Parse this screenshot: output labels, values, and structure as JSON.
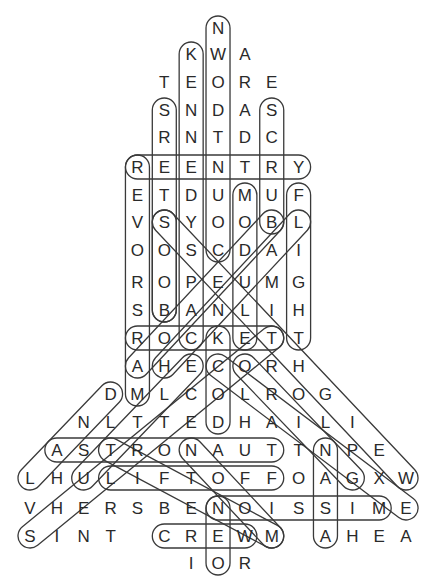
{
  "puzzle": {
    "type": "word-search",
    "grid_origin": {
      "x": 30,
      "y_rows": [
        28,
        54,
        82,
        110,
        137,
        167,
        195,
        222,
        250,
        282,
        310,
        338,
        366,
        394,
        422,
        450,
        478,
        508,
        536,
        563
      ]
    },
    "col_step": 26.86,
    "rows": [
      {
        "r": 0,
        "start": 7,
        "letters": "N"
      },
      {
        "r": 1,
        "start": 6,
        "letters": "KWA"
      },
      {
        "r": 2,
        "start": 5,
        "letters": "TEORE"
      },
      {
        "r": 3,
        "start": 5,
        "letters": "SNDAS"
      },
      {
        "r": 4,
        "start": 5,
        "letters": "RNTDC"
      },
      {
        "r": 5,
        "start": 4,
        "letters": "REENTRY"
      },
      {
        "r": 6,
        "start": 4,
        "letters": "ETDUMUF"
      },
      {
        "r": 7,
        "start": 4,
        "letters": "VSYOOBL"
      },
      {
        "r": 8,
        "start": 4,
        "letters": "OOSCDAI"
      },
      {
        "r": 9,
        "start": 4,
        "letters": "ROPEUMG"
      },
      {
        "r": 10,
        "start": 4,
        "letters": "SBANLIH"
      },
      {
        "r": 11,
        "start": 4,
        "letters": "ROCKETT"
      },
      {
        "r": 12,
        "start": 4,
        "letters": "AHECORH"
      },
      {
        "r": 13,
        "start": 3,
        "letters": "DMLCOLROG"
      },
      {
        "r": 14,
        "start": 2,
        "letters": "NLTTEDHAILI"
      },
      {
        "r": 15,
        "start": 1,
        "letters": "ASTRONAUTTNPE"
      },
      {
        "r": 16,
        "start": 0,
        "letters": "LHULIFTOFFOAGXW"
      },
      {
        "r": 17,
        "start": 0,
        "letters": "VHERSBENOISSIME"
      },
      {
        "r": 18,
        "start": 0,
        "letters": "SINT CREWM AHEA"
      },
      {
        "r": 19,
        "start": 6,
        "letters": "IOR"
      }
    ],
    "capsules": [
      {
        "word": "COUNTDOWN",
        "from": [
          7,
          0
        ],
        "to": [
          7,
          8
        ]
      },
      {
        "word": "KENNEDY",
        "from": [
          6,
          1
        ],
        "to": [
          6,
          11
        ]
      },
      {
        "word": "BOOSTERS",
        "from": [
          5,
          3
        ],
        "to": [
          5,
          10
        ]
      },
      {
        "word": "SCRUB",
        "from": [
          9,
          3
        ],
        "to": [
          9,
          7
        ]
      },
      {
        "word": "MARS ROVER",
        "from": [
          4,
          5
        ],
        "to": [
          4,
          13
        ]
      },
      {
        "word": "BOOS",
        "from": [
          5,
          7
        ],
        "to": [
          5,
          10
        ]
      },
      {
        "word": "MODULE",
        "from": [
          8,
          6
        ],
        "to": [
          8,
          11
        ]
      },
      {
        "word": "FLIGHT",
        "from": [
          10,
          6
        ],
        "to": [
          10,
          11
        ]
      },
      {
        "word": "DOCK",
        "from": [
          7,
          11
        ],
        "to": [
          7,
          14
        ]
      },
      {
        "word": "NASA",
        "from": [
          11,
          15
        ],
        "to": [
          11,
          18
        ]
      },
      {
        "word": "REENTRY",
        "from": [
          4,
          5
        ],
        "to": [
          10,
          5
        ]
      },
      {
        "word": "ROCKET",
        "from": [
          4,
          11
        ],
        "to": [
          9,
          11
        ]
      },
      {
        "word": "ASTRONAUT",
        "from": [
          1,
          15
        ],
        "to": [
          9,
          15
        ]
      },
      {
        "word": "LIFTOFF",
        "from": [
          3,
          16
        ],
        "to": [
          9,
          16
        ]
      },
      {
        "word": "MISSION",
        "from": [
          7,
          17
        ],
        "to": [
          13,
          17
        ]
      },
      {
        "word": "CREW",
        "from": [
          5,
          18
        ],
        "to": [
          8,
          18
        ]
      },
      {
        "word": "LAUNCH",
        "from": [
          10,
          7
        ],
        "to": [
          5,
          12
        ]
      },
      {
        "word": "DIAG-A",
        "from": [
          5,
          7
        ],
        "to": [
          14,
          16
        ]
      },
      {
        "word": "DIAG-B",
        "from": [
          9,
          7
        ],
        "to": [
          4,
          12
        ]
      },
      {
        "word": "DIAG-C",
        "from": [
          3,
          13
        ],
        "to": [
          0,
          16
        ]
      },
      {
        "word": "DIAG-D",
        "from": [
          9,
          11
        ],
        "to": [
          0,
          18
        ]
      },
      {
        "word": "DIAG-E",
        "from": [
          6,
          12
        ],
        "to": [
          2,
          16
        ]
      },
      {
        "word": "DIAG-F",
        "from": [
          7,
          12
        ],
        "to": [
          14,
          17
        ]
      },
      {
        "word": "DIAG-G",
        "from": [
          3,
          15
        ],
        "to": [
          9,
          18
        ]
      },
      {
        "word": "DIAG-H",
        "from": [
          8,
          12
        ],
        "to": [
          12,
          16
        ]
      },
      {
        "word": "DIAG-I",
        "from": [
          6,
          15
        ],
        "to": [
          9,
          18
        ]
      },
      {
        "word": "DIAG-J",
        "from": [
          7,
          17
        ],
        "to": [
          7,
          19
        ]
      }
    ]
  }
}
